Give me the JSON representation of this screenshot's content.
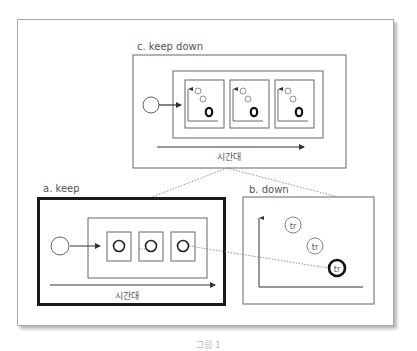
{
  "figure": {
    "panel_c": {
      "title": "c. keep down",
      "time_label": "시간대"
    },
    "panel_a": {
      "title": "a. keep",
      "time_label": "시간대"
    },
    "panel_b": {
      "title": "b. down",
      "circle_labels": [
        "tr",
        "tr",
        "tr"
      ]
    },
    "caption": "그림 1"
  },
  "colors": {
    "line": "#555555",
    "dark": "#1a1a1a",
    "frame": "#a9a9a9",
    "text": "#555555"
  }
}
